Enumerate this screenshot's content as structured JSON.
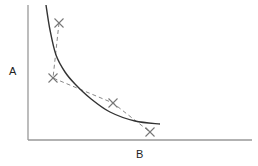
{
  "chart_data": {
    "type": "line",
    "title": "",
    "xlabel": "B",
    "ylabel": "A",
    "grid": false,
    "legend": null,
    "axis_ticks": "none",
    "series": [
      {
        "name": "fitted-curve",
        "style": "solid",
        "color": "#333333",
        "description": "smooth decreasing convex curve (hyperbola-like)",
        "points_px": [
          [
            46,
            5
          ],
          [
            50,
            30
          ],
          [
            56,
            55
          ],
          [
            65,
            72
          ],
          [
            75,
            84
          ],
          [
            90,
            98
          ],
          [
            110,
            112
          ],
          [
            135,
            121
          ],
          [
            160,
            124
          ]
        ]
      },
      {
        "name": "observations",
        "style": "dashed",
        "marker": "x",
        "color": "#777777",
        "points_px": [
          [
            59,
            23
          ],
          [
            53,
            78
          ],
          [
            113,
            103
          ],
          [
            150,
            132
          ]
        ]
      }
    ]
  },
  "colors": {
    "axis": "#999999",
    "curve": "#333333",
    "dashed": "#888888",
    "marker": "#777777"
  }
}
